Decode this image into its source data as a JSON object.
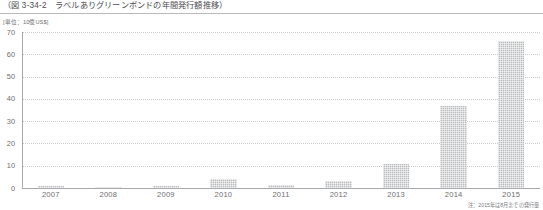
{
  "figure": {
    "title": "（図 3-34-2　ラベルありグリーンボンドの年間発行額推移）",
    "unit_label": "[単位：10億US$]",
    "footnote": "注：2015年は8月までの発行量"
  },
  "chart_data": {
    "type": "bar",
    "title": "（図 3-34-2　ラベルありグリーンボンドの年間発行額推移）",
    "xlabel": "",
    "ylabel": "[単位：10億US$]",
    "categories": [
      "2007",
      "2008",
      "2009",
      "2010",
      "2011",
      "2012",
      "2013",
      "2014",
      "2015"
    ],
    "values": [
      0.8,
      0.4,
      0.9,
      4.0,
      1.2,
      3.1,
      11.0,
      36.6,
      65.9
    ],
    "ylim": [
      0,
      70
    ],
    "yticks": [
      0,
      10,
      20,
      30,
      40,
      50,
      60,
      70
    ],
    "ytick_labels": [
      "0",
      "10",
      "20",
      "30",
      "40",
      "50",
      "60",
      "70"
    ],
    "grid": true,
    "grid_style": "dotted-horizontal",
    "legend": false,
    "bar_color": "#b9babc",
    "axis_color": "#a7a9ac",
    "text_color": "#6d6e70",
    "annotations": [
      "注：2015年は8月までの発行量"
    ]
  }
}
